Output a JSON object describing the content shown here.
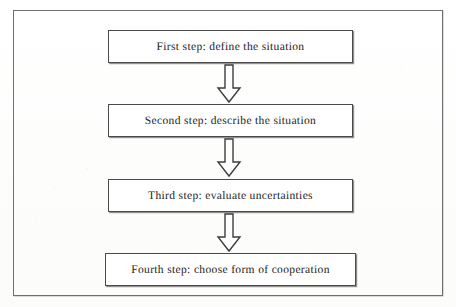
{
  "figure": {
    "frame": "outer-rectangle-border",
    "border_color": "#6f6f6f",
    "box_border_color": "#4a4a4a",
    "background_color": "#fefefe",
    "text_color": "#1c1c1c"
  },
  "flow": {
    "orientation": "vertical-top-to-bottom",
    "connector_icon": "down-arrow-icon",
    "steps": [
      {
        "label": "First step: define the situation"
      },
      {
        "label": "Second step: describe the situation"
      },
      {
        "label": "Third step: evaluate uncertainties"
      },
      {
        "label": "Fourth step: choose form of cooperation"
      }
    ],
    "connectors": [
      {
        "label": "down-arrow"
      },
      {
        "label": "down-arrow"
      },
      {
        "label": "down-arrow"
      }
    ]
  }
}
